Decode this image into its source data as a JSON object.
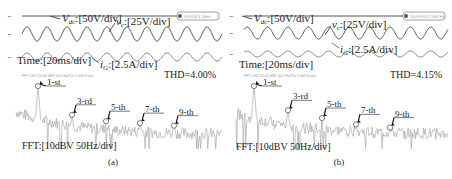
{
  "chart_data": [
    {
      "type": "line",
      "panel": "a",
      "caption": "(a)",
      "waveform": {
        "labels": {
          "vdc": "V_dc:[50V/div]",
          "vc": "v_c:[25V/div]",
          "ig": "i_G:[2.5A/div]",
          "time": "Time:[20ms/div]"
        },
        "scope_badge": "ΛΛΛΛΛ 1 1kHz",
        "cycles_shown": 10
      },
      "fft": {
        "label": "FFT:[10dBV 50Hz/div]",
        "header": "FFT  CH2  10.00 dBV   50.0 Hz/Div   5.000 Ksa/s",
        "thd": "THD=4.00%",
        "harmonics": [
          {
            "order": "1-st",
            "rel_level": 1.0
          },
          {
            "order": "3-rd",
            "rel_level": 0.55
          },
          {
            "order": "5-th",
            "rel_level": 0.45
          },
          {
            "order": "7-th",
            "rel_level": 0.42
          },
          {
            "order": "9-th",
            "rel_level": 0.38
          }
        ]
      }
    },
    {
      "type": "line",
      "panel": "b",
      "caption": "(b)",
      "waveform": {
        "labels": {
          "vdc": "V_dc:[50V/div]",
          "vc": "v_c:[25V/div]",
          "ig": "i_G:[2.5A/div]",
          "time": "Time:[20ms/div]"
        },
        "scope_badge": "ΛΛΛΛΛ 417.946 Hz",
        "cycles_shown": 10
      },
      "fft": {
        "label": "FFT:[10dBV 50Hz/div]",
        "header": "FFT  CH2  10.00 dBV   50.0 Hz/Div   5.000 Ksa/s",
        "thd": "THD=4.15%",
        "harmonics": [
          {
            "order": "1-st",
            "rel_level": 1.0
          },
          {
            "order": "3-rd",
            "rel_level": 0.62
          },
          {
            "order": "5-th",
            "rel_level": 0.5
          },
          {
            "order": "7-th",
            "rel_level": 0.4
          },
          {
            "order": "9-th",
            "rel_level": 0.35
          }
        ]
      }
    }
  ]
}
